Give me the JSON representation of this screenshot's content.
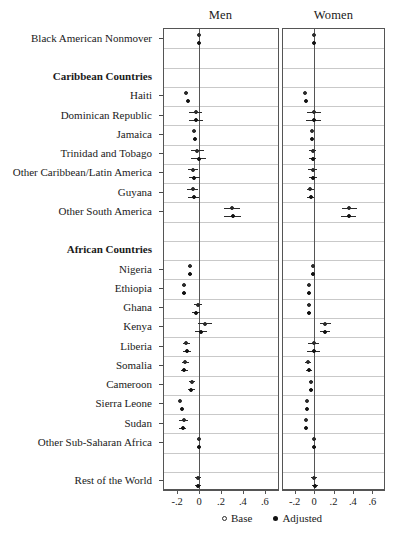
{
  "chart_data": {
    "type": "scatter",
    "title": "",
    "subtitle": "",
    "xlabel": "",
    "ylabel": "",
    "xlim": [
      -0.32,
      0.72
    ],
    "xticks": [
      -0.2,
      0,
      0.2,
      0.4,
      0.6
    ],
    "xticklabels": [
      "-.2",
      "0",
      ".2",
      ".4",
      ".6"
    ],
    "grid": true,
    "legend_position": "bottom-right",
    "reference_line": 0,
    "panels": [
      {
        "name": "men",
        "label": "Men"
      },
      {
        "name": "women",
        "label": "Women"
      }
    ],
    "legend": [
      {
        "key": "base",
        "label": "Base",
        "marker": "open-circle"
      },
      {
        "key": "adjusted",
        "label": "Adjusted",
        "marker": "filled-circle"
      }
    ],
    "categories": [
      {
        "label": "Black American Nonmover",
        "type": "row",
        "men": {
          "base": {
            "est": -0.005,
            "lo": -0.005,
            "hi": -0.005
          },
          "adjusted": {
            "est": -0.005,
            "lo": -0.005,
            "hi": -0.005
          }
        },
        "women": {
          "base": {
            "est": -0.005,
            "lo": -0.005,
            "hi": -0.005
          },
          "adjusted": {
            "est": -0.005,
            "lo": -0.005,
            "hi": -0.005
          }
        }
      },
      {
        "label": "",
        "type": "spacer"
      },
      {
        "label": "Caribbean Countries",
        "type": "header"
      },
      {
        "label": "Haiti",
        "type": "row",
        "men": {
          "base": {
            "est": -0.115,
            "lo": -0.125,
            "hi": -0.105
          },
          "adjusted": {
            "est": -0.1,
            "lo": -0.11,
            "hi": -0.09
          }
        },
        "women": {
          "base": {
            "est": -0.095,
            "lo": -0.105,
            "hi": -0.085
          },
          "adjusted": {
            "est": -0.085,
            "lo": -0.095,
            "hi": -0.075
          }
        }
      },
      {
        "label": "Dominican Republic",
        "type": "row",
        "men": {
          "base": {
            "est": -0.03,
            "lo": -0.09,
            "hi": 0.03
          },
          "adjusted": {
            "est": -0.025,
            "lo": -0.09,
            "hi": 0.04
          }
        },
        "women": {
          "base": {
            "est": -0.005,
            "lo": -0.075,
            "hi": 0.07
          },
          "adjusted": {
            "est": -0.005,
            "lo": -0.08,
            "hi": 0.075
          }
        }
      },
      {
        "label": "Jamaica",
        "type": "row",
        "men": {
          "base": {
            "est": -0.045,
            "lo": -0.06,
            "hi": -0.03
          },
          "adjusted": {
            "est": -0.04,
            "lo": -0.055,
            "hi": -0.025
          }
        },
        "women": {
          "base": {
            "est": -0.02,
            "lo": -0.032,
            "hi": -0.008
          },
          "adjusted": {
            "est": -0.018,
            "lo": -0.03,
            "hi": -0.006
          }
        }
      },
      {
        "label": "Trinidad and Tobago",
        "type": "row",
        "men": {
          "base": {
            "est": -0.015,
            "lo": -0.075,
            "hi": 0.045
          },
          "adjusted": {
            "est": -0.005,
            "lo": -0.07,
            "hi": 0.06
          }
        },
        "women": {
          "base": {
            "est": -0.015,
            "lo": -0.05,
            "hi": 0.02
          },
          "adjusted": {
            "est": -0.012,
            "lo": -0.048,
            "hi": 0.024
          }
        }
      },
      {
        "label": "Other Caribbean/Latin America",
        "type": "row",
        "men": {
          "base": {
            "est": -0.055,
            "lo": -0.1,
            "hi": -0.01
          },
          "adjusted": {
            "est": -0.045,
            "lo": -0.095,
            "hi": 0.005
          }
        },
        "women": {
          "base": {
            "est": -0.015,
            "lo": -0.06,
            "hi": 0.03
          },
          "adjusted": {
            "est": -0.01,
            "lo": -0.055,
            "hi": 0.035
          }
        }
      },
      {
        "label": "Guyana",
        "type": "row",
        "men": {
          "base": {
            "est": -0.06,
            "lo": -0.11,
            "hi": -0.01
          },
          "adjusted": {
            "est": -0.05,
            "lo": -0.1,
            "hi": 0.0
          }
        },
        "women": {
          "base": {
            "est": -0.04,
            "lo": -0.075,
            "hi": -0.005
          },
          "adjusted": {
            "est": -0.035,
            "lo": -0.07,
            "hi": 0.0
          }
        }
      },
      {
        "label": "Other South America",
        "type": "row",
        "men": {
          "base": {
            "est": 0.3,
            "lo": 0.225,
            "hi": 0.375
          },
          "adjusted": {
            "est": 0.305,
            "lo": 0.23,
            "hi": 0.38
          }
        },
        "women": {
          "base": {
            "est": 0.36,
            "lo": 0.285,
            "hi": 0.44
          },
          "adjusted": {
            "est": 0.355,
            "lo": 0.28,
            "hi": 0.435
          }
        }
      },
      {
        "label": "",
        "type": "spacer"
      },
      {
        "label": "African Countries",
        "type": "header"
      },
      {
        "label": "Nigeria",
        "type": "row",
        "men": {
          "base": {
            "est": -0.085,
            "lo": -0.105,
            "hi": -0.065
          },
          "adjusted": {
            "est": -0.08,
            "lo": -0.1,
            "hi": -0.06
          }
        },
        "women": {
          "base": {
            "est": -0.01,
            "lo": -0.025,
            "hi": 0.005
          },
          "adjusted": {
            "est": -0.015,
            "lo": -0.03,
            "hi": 0.0
          }
        }
      },
      {
        "label": "Ethiopia",
        "type": "row",
        "men": {
          "base": {
            "est": -0.14,
            "lo": -0.16,
            "hi": -0.12
          },
          "adjusted": {
            "est": -0.14,
            "lo": -0.16,
            "hi": -0.12
          }
        },
        "women": {
          "base": {
            "est": -0.055,
            "lo": -0.072,
            "hi": -0.038
          },
          "adjusted": {
            "est": -0.055,
            "lo": -0.072,
            "hi": -0.038
          }
        }
      },
      {
        "label": "Ghana",
        "type": "row",
        "men": {
          "base": {
            "est": -0.01,
            "lo": -0.05,
            "hi": 0.03
          },
          "adjusted": {
            "est": -0.03,
            "lo": -0.065,
            "hi": 0.005
          }
        },
        "women": {
          "base": {
            "est": -0.05,
            "lo": -0.068,
            "hi": -0.032
          },
          "adjusted": {
            "est": -0.05,
            "lo": -0.068,
            "hi": -0.032
          }
        }
      },
      {
        "label": "Kenya",
        "type": "row",
        "men": {
          "base": {
            "est": 0.055,
            "lo": -0.01,
            "hi": 0.12
          },
          "adjusted": {
            "est": 0.02,
            "lo": -0.035,
            "hi": 0.075
          }
        },
        "women": {
          "base": {
            "est": 0.115,
            "lo": 0.065,
            "hi": 0.17
          },
          "adjusted": {
            "est": 0.11,
            "lo": 0.06,
            "hi": 0.165
          }
        }
      },
      {
        "label": "Liberia",
        "type": "row",
        "men": {
          "base": {
            "est": -0.115,
            "lo": -0.15,
            "hi": -0.08
          },
          "adjusted": {
            "est": -0.11,
            "lo": -0.145,
            "hi": -0.075
          }
        },
        "women": {
          "base": {
            "est": -0.005,
            "lo": -0.065,
            "hi": 0.055
          },
          "adjusted": {
            "est": -0.005,
            "lo": -0.07,
            "hi": 0.06
          }
        }
      },
      {
        "label": "Somalia",
        "type": "row",
        "men": {
          "base": {
            "est": -0.125,
            "lo": -0.155,
            "hi": -0.095
          },
          "adjusted": {
            "est": -0.135,
            "lo": -0.165,
            "hi": -0.105
          }
        },
        "women": {
          "base": {
            "est": -0.06,
            "lo": -0.09,
            "hi": -0.03
          },
          "adjusted": {
            "est": -0.055,
            "lo": -0.085,
            "hi": -0.025
          }
        },
        "_": ""
      },
      {
        "label": "Cameroon",
        "type": "row",
        "men": {
          "base": {
            "est": -0.065,
            "lo": -0.095,
            "hi": -0.035
          },
          "adjusted": {
            "est": -0.07,
            "lo": -0.1,
            "hi": -0.04
          }
        },
        "women": {
          "base": {
            "est": -0.035,
            "lo": -0.055,
            "hi": -0.015
          },
          "adjusted": {
            "est": -0.035,
            "lo": -0.055,
            "hi": -0.015
          }
        }
      },
      {
        "label": "Sierra Leone",
        "type": "row",
        "men": {
          "base": {
            "est": -0.17,
            "lo": -0.175,
            "hi": -0.165
          },
          "adjusted": {
            "est": -0.16,
            "lo": -0.165,
            "hi": -0.155
          }
        },
        "women": {
          "base": {
            "est": -0.075,
            "lo": -0.08,
            "hi": -0.07
          },
          "adjusted": {
            "est": -0.075,
            "lo": -0.08,
            "hi": -0.07
          }
        }
      },
      {
        "label": "Sudan",
        "type": "row",
        "men": {
          "base": {
            "est": -0.14,
            "lo": -0.18,
            "hi": -0.1
          },
          "adjusted": {
            "est": -0.15,
            "lo": -0.185,
            "hi": -0.115
          }
        },
        "women": {
          "base": {
            "est": -0.08,
            "lo": -0.085,
            "hi": -0.075
          },
          "adjusted": {
            "est": -0.08,
            "lo": -0.085,
            "hi": -0.075
          }
        }
      },
      {
        "label": "Other Sub-Saharan Africa",
        "type": "row",
        "men": {
          "base": {
            "est": -0.005,
            "lo": -0.02,
            "hi": 0.01
          },
          "adjusted": {
            "est": -0.005,
            "lo": -0.02,
            "hi": 0.01
          }
        },
        "women": {
          "base": {
            "est": 0.002,
            "lo": -0.012,
            "hi": 0.016
          },
          "adjusted": {
            "est": 0.002,
            "lo": -0.012,
            "hi": 0.016
          }
        }
      },
      {
        "label": "",
        "type": "spacer"
      },
      {
        "label": "Rest of the World",
        "type": "row",
        "men": {
          "base": {
            "est": -0.012,
            "lo": -0.04,
            "hi": 0.016
          },
          "adjusted": {
            "est": -0.012,
            "lo": -0.04,
            "hi": 0.016
          }
        },
        "women": {
          "base": {
            "est": 0.002,
            "lo": -0.03,
            "hi": 0.034
          },
          "adjusted": {
            "est": 0.006,
            "lo": -0.026,
            "hi": 0.038
          }
        }
      }
    ]
  },
  "colors": {
    "frame": "#555555",
    "grid": "#c9c9c9",
    "marker": "#111111",
    "text": "#1a1a1a",
    "background": "#ffffff"
  }
}
